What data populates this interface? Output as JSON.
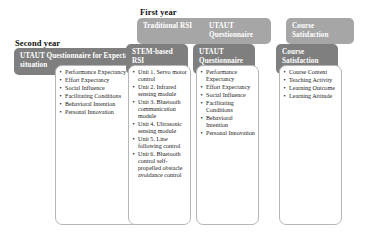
{
  "diagram": {
    "colors": {
      "chip_back": "#a6a6a6",
      "chip_front": "#7f7f7f",
      "panel_border": "#b6b6b6",
      "text_light": "#ffffff",
      "text_dark": "#1a1a1a"
    },
    "year_labels": {
      "first": "First year",
      "second": "Second year"
    },
    "columns": [
      {
        "id": "questionnaire-expectation",
        "chip_back": null,
        "chip_front": "UTAUT Questionnaire for Expectation situation",
        "items": [
          "Performance Expectancy",
          "Effort Expectancy",
          "Social Influence",
          "Facilitating Conditions",
          "Behavioral Intention",
          "Personal Innovation"
        ]
      },
      {
        "id": "rsi-course",
        "chip_back": "Traditional RSI",
        "chip_front": "STEM-based RSI",
        "items": [
          "Unit 1. Servo motor control",
          "Unit 2. Infrared sensing module",
          "Unit 3. Bluetooth communication module",
          "Unit 4. Ultrasonic sensing module",
          "Unit 5. Line following control",
          "Unit 6. Bluetooth control self-propelled obstacle avoidance control"
        ]
      },
      {
        "id": "utaut-questionnaire",
        "chip_back": "UTAUT Questionnaire",
        "chip_front": "UTAUT Questionnaire",
        "items": [
          "Performance Expectancy",
          "Effort Expectancy",
          "Social Influence",
          "Facilitating Conditions",
          "Behavioral Intention",
          "Personal Innovation"
        ]
      },
      {
        "id": "course-satisfaction",
        "chip_back": "Course Satisfaction",
        "chip_front": "Course Satisfaction",
        "items": [
          "Course Content",
          "Teaching Activity",
          "Learning Outcome",
          "Learning Attitude"
        ]
      }
    ]
  }
}
